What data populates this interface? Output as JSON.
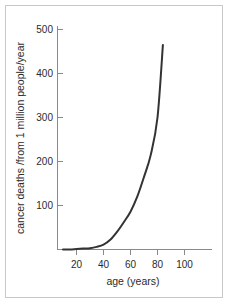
{
  "chart_data": {
    "type": "line",
    "title": "",
    "xlabel": "age (years)",
    "ylabel": "cancer deaths /from 1 million people/year",
    "xlim": [
      10,
      104
    ],
    "ylim": [
      0,
      520
    ],
    "xticks": [
      20,
      40,
      60,
      80,
      100
    ],
    "yticks": [
      100,
      200,
      300,
      400,
      500
    ],
    "xtick_labels": [
      "20",
      "40",
      "60",
      "80",
      "100"
    ],
    "ytick_labels": [
      "100",
      "200",
      "300",
      "400",
      "500"
    ],
    "grid": false,
    "legend": null,
    "series": [
      {
        "name": "cancer deaths per million per year",
        "color": "#333333",
        "x": [
          10,
          15,
          20,
          25,
          30,
          35,
          40,
          45,
          50,
          55,
          60,
          65,
          70,
          75,
          80,
          84
        ],
        "y": [
          0,
          0,
          1,
          2,
          3,
          6,
          11,
          22,
          40,
          62,
          86,
          120,
          165,
          215,
          300,
          465
        ]
      }
    ],
    "annotations": []
  },
  "axes": {
    "x_axis_label": "age (years)",
    "y_axis_label": "cancer deaths /from 1 million people/year"
  },
  "colors": {
    "curve": "#333333",
    "axis": "#8a8a8a",
    "text": "#2b2b2b",
    "frame": "#c8c8c8",
    "background": "#ffffff"
  }
}
